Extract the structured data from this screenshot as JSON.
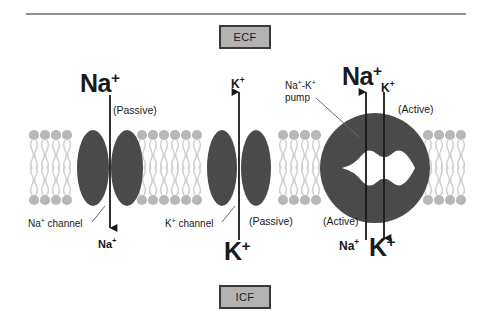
{
  "figure": {
    "colors": {
      "protein_dark": "#4a4a4a",
      "lipid_head": "#b8b8b8",
      "lipid_tail": "#cfcfcf",
      "box_fill": "#b2b2b2",
      "box_border": "#3b3b3b",
      "rule": "#8f8f8f",
      "arrow": "#1a1a1a"
    }
  },
  "compartments": {
    "extracellular_label": "ECF",
    "intracellular_label": "ICF"
  },
  "sodium_channel": {
    "top_ion": "Na",
    "top_ion_charge": "+",
    "transport_note": "(Passive)",
    "structure_label": "Na",
    "structure_label_charge": "+",
    "structure_label_rest": " channel",
    "bottom_ion": "Na",
    "bottom_ion_charge": "+",
    "direction": "inward"
  },
  "potassium_channel": {
    "top_ion": "K",
    "top_ion_charge": "+",
    "transport_note": "(Passive)",
    "structure_label": "K",
    "structure_label_charge": "+",
    "structure_label_rest": " channel",
    "bottom_ion": "K",
    "bottom_ion_charge": "+",
    "direction": "outward"
  },
  "pump": {
    "name_line1": "Na",
    "name_line1_charge": "+",
    "name_line1_rest": "-K",
    "name_line1_charge2": "+",
    "name_line2": "pump",
    "top_ion_out": "Na",
    "top_ion_out_charge": "+",
    "top_ion_in": "K",
    "top_ion_in_charge": "+",
    "top_note": "(Active)",
    "bottom_note": "(Active)",
    "bottom_ion_out": "Na",
    "bottom_ion_out_charge": "+",
    "bottom_ion_in": "K",
    "bottom_ion_in_charge": "+",
    "sodium_direction": "outward",
    "potassium_direction": "inward"
  }
}
